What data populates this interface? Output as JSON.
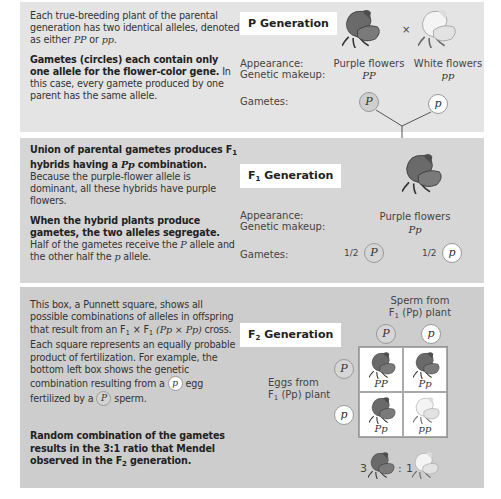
{
  "panels": {
    "p_generation": {
      "label": "P Generation",
      "text_intro": "Each true-breeding plant of the parental generation has two identical alleles, denoted as either ",
      "text_intro_a": "PP",
      "text_intro_or": " or ",
      "text_intro_b": "pp",
      "text_intro_end": ".",
      "bold_heading": "Gametes (circles) each contain only one allele for the flower-color gene.",
      "body": "In this case, every gamete produced by one parent has the same allele.",
      "appearance_label": "Appearance:",
      "genetic_label": "Genetic makeup:",
      "gametes_label": "Gametes:",
      "cross_symbol": "×",
      "parents": [
        {
          "appearance": "Purple flowers",
          "genotype": "PP",
          "gamete": "P",
          "color": "purple"
        },
        {
          "appearance": "White flowers",
          "genotype": "pp",
          "gamete": "p",
          "color": "white"
        }
      ]
    },
    "f1_generation": {
      "label_prefix": "F",
      "label_sub": "1",
      "label_suffix": " Generation",
      "bold_1a": "Union of parental gametes produces F",
      "bold_1sub": "1",
      "bold_1b": " hybrids having a ",
      "bold_1geno": "Pp",
      "bold_1c": " combination.",
      "body_1": "Because the purple-flower allele is dominant, all these hybrids have purple flowers.",
      "bold_2": "When the hybrid plants produce gametes, the two alleles segregate.",
      "body_2a": "Half of the gametes receive the ",
      "body_2P": "P",
      "body_2b": " allele and the other half the ",
      "body_2p": "p",
      "body_2c": " allele.",
      "appearance_label": "Appearance:",
      "genetic_label": "Genetic makeup:",
      "gametes_label": "Gametes:",
      "appearance": "Purple flowers",
      "genotype": "Pp",
      "gametes": [
        {
          "fraction": "1/2",
          "allele": "P"
        },
        {
          "fraction": "1/2",
          "allele": "p"
        }
      ]
    },
    "f2_generation": {
      "label_prefix": "F",
      "label_sub": "2",
      "label_suffix": " Generation",
      "body_1": "This box, a Punnett square, shows all possible combinations of alleles in offspring that result from an F",
      "body_1sub": "1",
      "body_1x": " × F",
      "body_1sub2": "1",
      "body_1cross": " (Pp × Pp)",
      "body_2": " cross. Each square represents an equally probable product of fertilization. For example, the bottom left box shows the genetic combination resulting from a ",
      "body_egg": "p",
      "body_3": " egg fertilized by a ",
      "body_sperm": "P",
      "body_4": " sperm.",
      "bold_a": "Random combination of the gametes results in the 3:1 ratio that Mendel observed in the F",
      "bold_sub": "2",
      "bold_b": " generation.",
      "sperm_label_1": "Sperm from",
      "sperm_label_2a": "F",
      "sperm_label_2sub": "1",
      "sperm_label_2b": " (Pp) plant",
      "eggs_label_1": "Eggs from",
      "eggs_label_2a": "F",
      "eggs_label_2sub": "1",
      "eggs_label_2b": " (Pp) plant",
      "sperm_alleles": [
        "P",
        "p"
      ],
      "egg_alleles": [
        "P",
        "p"
      ],
      "punnett": [
        {
          "genotype": "PP",
          "color": "purple"
        },
        {
          "genotype": "Pp",
          "color": "purple"
        },
        {
          "genotype": "Pp",
          "color": "purple"
        },
        {
          "genotype": "pp",
          "color": "white"
        }
      ],
      "ratio_purple": "3",
      "ratio_sep": ":",
      "ratio_white": "1"
    }
  },
  "colors": {
    "panel_top": "#e4e4e4",
    "panel_mid": "#d6d6d6",
    "panel_bottom": "#cdcdcd",
    "purple_flower": "#5a5a5a",
    "white_flower": "#e8e8e8"
  }
}
